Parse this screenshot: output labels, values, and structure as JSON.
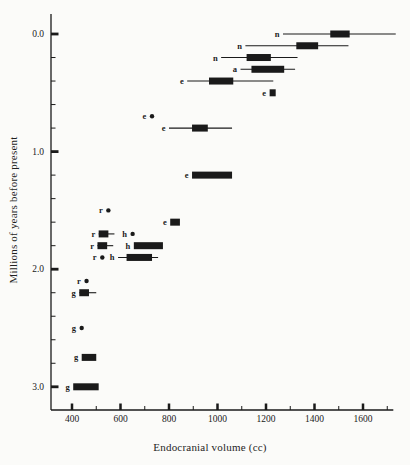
{
  "figure": {
    "background_color": "#fbfbf9",
    "ink_color": "#1a1a1a"
  },
  "chart_data": {
    "type": "bar",
    "subtype": "horizontal-box-whisker-timeline",
    "title": "",
    "xlabel": "Endocranial volume (cc)",
    "ylabel": "Millions of years before present",
    "x_axis": {
      "ticks": [
        400,
        600,
        800,
        1000,
        1200,
        1400,
        1600
      ],
      "minor_ticks": [
        500,
        700,
        900,
        1100,
        1300,
        1500,
        1700
      ],
      "range": [
        315,
        1725
      ]
    },
    "y_axis": {
      "tick_labels": [
        "0.0",
        "1.0",
        "2.0",
        "3.0"
      ],
      "tick_values": [
        0.0,
        1.0,
        2.0,
        3.0
      ],
      "minor_ticks": [
        0.2,
        0.4,
        0.6,
        0.8,
        1.2,
        1.4,
        1.6,
        1.8,
        2.2,
        2.4,
        2.6,
        2.8
      ],
      "range": [
        -0.17,
        3.2
      ]
    },
    "group_letters": [
      "n",
      "a",
      "e",
      "h",
      "r",
      "g"
    ],
    "rows": [
      {
        "group": "n",
        "t": 0.0,
        "whiskers": [
          1270,
          1735
        ],
        "box": [
          1465,
          1545
        ]
      },
      {
        "group": "n",
        "t": 0.1,
        "whiskers": [
          1115,
          1540
        ],
        "box": [
          1325,
          1415
        ]
      },
      {
        "group": "n",
        "t": 0.2,
        "whiskers": [
          1015,
          1330
        ],
        "box": [
          1120,
          1220
        ]
      },
      {
        "group": "a",
        "t": 0.3,
        "whiskers": [
          1095,
          1320
        ],
        "box": [
          1140,
          1275
        ]
      },
      {
        "group": "e",
        "t": 0.4,
        "whiskers": [
          875,
          1230
        ],
        "box": [
          965,
          1065
        ]
      },
      {
        "group": "e",
        "t": 0.5,
        "box": [
          1215,
          1240
        ]
      },
      {
        "group": "e",
        "t": 0.7,
        "point": 730
      },
      {
        "group": "e",
        "t": 0.8,
        "whiskers": [
          800,
          1060
        ],
        "box": [
          895,
          960
        ]
      },
      {
        "group": "e",
        "t": 1.2,
        "box": [
          895,
          1060
        ]
      },
      {
        "group": "r",
        "t": 1.5,
        "point": 550
      },
      {
        "group": "e",
        "t": 1.6,
        "box": [
          805,
          845
        ]
      },
      {
        "group": "r",
        "t": 1.7,
        "whiskers": [
          510,
          575
        ],
        "box": [
          510,
          550
        ]
      },
      {
        "group": "h",
        "t": 1.7,
        "point": 650
      },
      {
        "group": "r",
        "t": 1.8,
        "whiskers": [
          505,
          570
        ],
        "box": [
          505,
          545
        ]
      },
      {
        "group": "h",
        "t": 1.8,
        "box": [
          655,
          775
        ]
      },
      {
        "group": "r",
        "t": 1.9,
        "point": 525
      },
      {
        "group": "h",
        "t": 1.9,
        "whiskers": [
          590,
          755
        ],
        "box": [
          625,
          730
        ]
      },
      {
        "group": "r",
        "t": 2.1,
        "point": 460
      },
      {
        "group": "g",
        "t": 2.2,
        "whiskers": [
          430,
          500
        ],
        "box": [
          430,
          470
        ]
      },
      {
        "group": "g",
        "t": 2.5,
        "point": 440
      },
      {
        "group": "g",
        "t": 2.75,
        "box": [
          440,
          500
        ]
      },
      {
        "group": "g",
        "t": 3.0,
        "box": [
          405,
          510
        ]
      }
    ]
  }
}
